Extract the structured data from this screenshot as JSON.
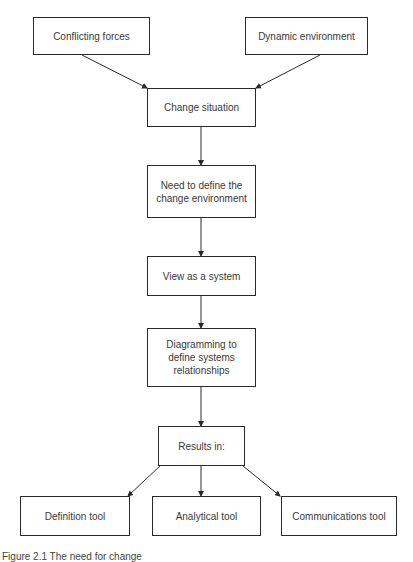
{
  "diagram": {
    "nodes": [
      {
        "id": "conflicting-forces",
        "label": "Conflicting forces",
        "x": 33,
        "y": 17,
        "w": 117,
        "h": 38
      },
      {
        "id": "dynamic-environment",
        "label": "Dynamic environment",
        "x": 245,
        "y": 17,
        "w": 123,
        "h": 38
      },
      {
        "id": "change-situation",
        "label": "Change situation",
        "x": 147,
        "y": 88,
        "w": 109,
        "h": 39
      },
      {
        "id": "need-to-define",
        "label": "Need to define the change environment",
        "x": 147,
        "y": 165,
        "w": 109,
        "h": 53
      },
      {
        "id": "view-as-system",
        "label": "View as a system",
        "x": 147,
        "y": 256,
        "w": 109,
        "h": 40
      },
      {
        "id": "diagramming",
        "label": "Diagramming to define systems relationships",
        "x": 147,
        "y": 328,
        "w": 109,
        "h": 59
      },
      {
        "id": "results-in",
        "label": "Results in:",
        "x": 158,
        "y": 426,
        "w": 87,
        "h": 40
      },
      {
        "id": "definition-tool",
        "label": "Definition tool",
        "x": 20,
        "y": 496,
        "w": 110,
        "h": 40
      },
      {
        "id": "analytical-tool",
        "label": "Analytical tool",
        "x": 152,
        "y": 496,
        "w": 109,
        "h": 40
      },
      {
        "id": "communications-tool",
        "label": "Communications tool",
        "x": 281,
        "y": 496,
        "w": 116,
        "h": 40
      }
    ],
    "edges": [
      {
        "from": "conflicting-forces",
        "to": "change-situation",
        "x1": 82,
        "y1": 55,
        "x2": 147,
        "y2": 88
      },
      {
        "from": "dynamic-environment",
        "to": "change-situation",
        "x1": 320,
        "y1": 55,
        "x2": 256,
        "y2": 88
      },
      {
        "from": "change-situation",
        "to": "need-to-define",
        "x1": 201,
        "y1": 127,
        "x2": 201,
        "y2": 165
      },
      {
        "from": "need-to-define",
        "to": "view-as-system",
        "x1": 201,
        "y1": 218,
        "x2": 201,
        "y2": 256
      },
      {
        "from": "view-as-system",
        "to": "diagramming",
        "x1": 201,
        "y1": 296,
        "x2": 201,
        "y2": 328
      },
      {
        "from": "diagramming",
        "to": "results-in",
        "x1": 201,
        "y1": 387,
        "x2": 201,
        "y2": 426
      },
      {
        "from": "results-in",
        "to": "definition-tool",
        "x1": 160,
        "y1": 466,
        "x2": 128,
        "y2": 496
      },
      {
        "from": "results-in",
        "to": "analytical-tool",
        "x1": 201,
        "y1": 466,
        "x2": 201,
        "y2": 496
      },
      {
        "from": "results-in",
        "to": "communications-tool",
        "x1": 243,
        "y1": 466,
        "x2": 280,
        "y2": 496
      }
    ],
    "line_color": "#2a2a2a"
  },
  "caption": "Figure 2.1   The need for change"
}
